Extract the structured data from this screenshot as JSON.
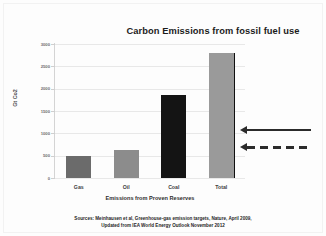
{
  "chart_data": {
    "type": "bar",
    "title": "Carbon Emissions from fossil fuel use",
    "xlabel": "Emissions from Proven Reserves",
    "ylabel": "Gt Co2",
    "categories": [
      "Gas",
      "Oil",
      "Coal",
      "Total"
    ],
    "values": [
      490,
      620,
      1850,
      2800
    ],
    "ylim": [
      0,
      3000
    ],
    "yticks": [
      3000,
      2500,
      2000,
      1500,
      1000,
      500,
      0
    ],
    "ytick_labels": [
      "3000",
      "2500",
      "2000",
      "1500",
      "1000",
      "500",
      "0"
    ],
    "grid": true,
    "legend": "none",
    "bar_colors": [
      "#6b6b6b",
      "#8c8c8c",
      "#141414",
      "#9a9a9a"
    ],
    "annotations": [
      {
        "name": "solid-arrow",
        "style": "solid",
        "direction": "left",
        "value_level": 1000
      },
      {
        "name": "dashed-arrow",
        "style": "dashed",
        "direction": "left",
        "value_level": 620
      }
    ]
  },
  "footnote": {
    "line1": "Sources: Meinhausen et al, Greenhouse-gas emission targets, Nature, April 2009,",
    "line2": "Updated from IEA World Energy Outlook November 2012"
  },
  "colors": {
    "title_text": "#1b1b1b",
    "grid": "#e8e8e8",
    "axis": "#d4d4d4",
    "background": "#fdfdfd"
  }
}
